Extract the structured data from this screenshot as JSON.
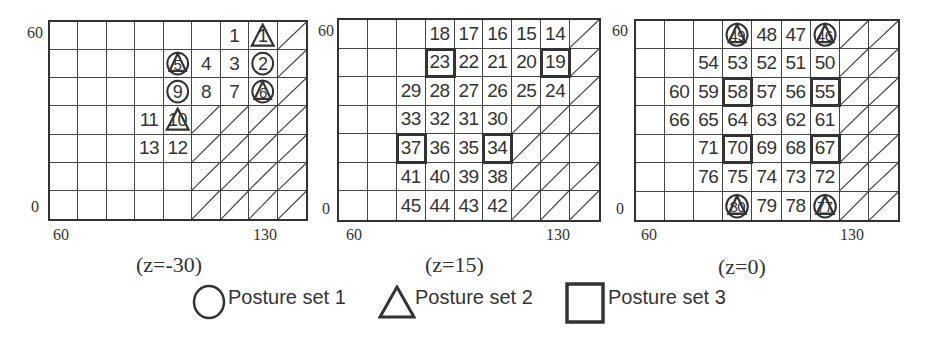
{
  "figure": {
    "grid_cols": 9,
    "grid_rows": 7,
    "axis_ticks": {
      "x_left": "60",
      "x_right": "130",
      "y_top": "60",
      "y_bottom": "0"
    },
    "panels": [
      {
        "caption": "(z=-30)",
        "box": {
          "left": 48,
          "top": 20,
          "width": 260,
          "height": 201
        },
        "cells": [
          [
            "",
            "",
            "",
            "",
            "",
            "",
            "1",
            "1",
            "#"
          ],
          [
            "",
            "",
            "",
            "",
            "5",
            "4",
            "3",
            "2",
            "#"
          ],
          [
            "",
            "",
            "",
            "",
            "9",
            "8",
            "7",
            "6",
            "#"
          ],
          [
            "",
            "",
            "",
            "11",
            "10",
            "#",
            "#",
            "#",
            "#"
          ],
          [
            "",
            "",
            "",
            "13",
            "12",
            "#",
            "#",
            "#",
            "#"
          ],
          [
            "",
            "",
            "",
            "",
            "",
            "#",
            "#",
            "#",
            "#"
          ],
          [
            "",
            "",
            "",
            "",
            "",
            "#",
            "#",
            "#",
            "#"
          ]
        ],
        "markers": [
          {
            "row": 0,
            "col": 7,
            "label": "1",
            "sets": [
              "triangle"
            ]
          },
          {
            "row": 1,
            "col": 4,
            "label": "5",
            "sets": [
              "circle",
              "triangle"
            ]
          },
          {
            "row": 1,
            "col": 7,
            "label": "2",
            "sets": [
              "circle"
            ]
          },
          {
            "row": 2,
            "col": 4,
            "label": "9",
            "sets": [
              "circle"
            ]
          },
          {
            "row": 2,
            "col": 7,
            "label": "6",
            "sets": [
              "circle",
              "triangle"
            ]
          },
          {
            "row": 3,
            "col": 4,
            "label": "10",
            "sets": [
              "triangle"
            ]
          }
        ],
        "tick_positions": {
          "x_left": [
            53,
            226
          ],
          "x_right": [
            253,
            226
          ],
          "y_top": [
            27,
            24
          ],
          "y_bottom": [
            31,
            198
          ]
        }
      },
      {
        "caption": "(z=15)",
        "box": {
          "left": 337,
          "top": 18,
          "width": 264,
          "height": 204
        },
        "cells": [
          [
            "",
            "",
            "",
            "18",
            "17",
            "16",
            "15",
            "14",
            "#"
          ],
          [
            "",
            "",
            "",
            "23",
            "22",
            "21",
            "20",
            "19",
            "#"
          ],
          [
            "",
            "",
            "29",
            "28",
            "27",
            "26",
            "25",
            "24",
            "#"
          ],
          [
            "",
            "",
            "33",
            "32",
            "31",
            "30",
            "#",
            "#",
            "#"
          ],
          [
            "",
            "",
            "37",
            "36",
            "35",
            "34",
            "#",
            "#",
            ""
          ],
          [
            "",
            "",
            "41",
            "40",
            "39",
            "38",
            "#",
            "#",
            "#"
          ],
          [
            "",
            "",
            "45",
            "44",
            "43",
            "42",
            "#",
            "#",
            "#"
          ]
        ],
        "markers": [
          {
            "row": 1,
            "col": 3,
            "label": "23",
            "sets": [
              "square"
            ]
          },
          {
            "row": 1,
            "col": 7,
            "label": "19",
            "sets": [
              "square"
            ]
          },
          {
            "row": 4,
            "col": 2,
            "label": "37",
            "sets": [
              "square"
            ]
          },
          {
            "row": 4,
            "col": 5,
            "label": "34",
            "sets": [
              "square"
            ]
          }
        ],
        "tick_positions": {
          "x_left": [
            346,
            226
          ],
          "x_right": [
            546,
            226
          ],
          "y_top": [
            318,
            22
          ],
          "y_bottom": [
            322,
            200
          ]
        }
      },
      {
        "caption": "(z=0)",
        "box": {
          "left": 634,
          "top": 19,
          "width": 266,
          "height": 203
        },
        "cells": [
          [
            "",
            "",
            "",
            "49",
            "48",
            "47",
            "46",
            "#",
            "#"
          ],
          [
            "",
            "",
            "54",
            "53",
            "52",
            "51",
            "50",
            "#",
            "#"
          ],
          [
            "",
            "60",
            "59",
            "58",
            "57",
            "56",
            "55",
            "#",
            "#"
          ],
          [
            "",
            "66",
            "65",
            "64",
            "63",
            "62",
            "61",
            "#",
            "#"
          ],
          [
            "",
            "",
            "71",
            "70",
            "69",
            "68",
            "67",
            "#",
            "#"
          ],
          [
            "",
            "",
            "76",
            "75",
            "74",
            "73",
            "72",
            "#",
            "#"
          ],
          [
            "",
            "",
            "",
            "80",
            "79",
            "78",
            "77",
            "#",
            "#"
          ]
        ],
        "markers": [
          {
            "row": 0,
            "col": 3,
            "label": "49",
            "sets": [
              "circle",
              "triangle"
            ]
          },
          {
            "row": 0,
            "col": 6,
            "label": "46",
            "sets": [
              "circle",
              "triangle"
            ]
          },
          {
            "row": 2,
            "col": 3,
            "label": "58",
            "sets": [
              "square"
            ]
          },
          {
            "row": 2,
            "col": 6,
            "label": "55",
            "sets": [
              "square"
            ]
          },
          {
            "row": 4,
            "col": 3,
            "label": "70",
            "sets": [
              "square"
            ]
          },
          {
            "row": 4,
            "col": 6,
            "label": "67",
            "sets": [
              "square"
            ]
          },
          {
            "row": 6,
            "col": 3,
            "label": "80",
            "sets": [
              "circle",
              "triangle"
            ]
          },
          {
            "row": 6,
            "col": 6,
            "label": "77",
            "sets": [
              "circle",
              "triangle"
            ]
          }
        ],
        "tick_positions": {
          "x_left": [
            641,
            226
          ],
          "x_right": [
            840,
            226
          ],
          "y_top": [
            612,
            22
          ],
          "y_bottom": [
            616,
            200
          ]
        }
      }
    ],
    "caption_positions": [
      [
        136,
        252
      ],
      [
        425,
        252
      ],
      [
        718,
        254
      ]
    ]
  },
  "legend": {
    "items": [
      {
        "shape": "circle",
        "label": "Posture set 1"
      },
      {
        "shape": "triangle",
        "label": "Posture set 2"
      },
      {
        "shape": "square",
        "label": "Posture set 3"
      }
    ]
  },
  "colors": {
    "line": "#333333",
    "text": "#333333",
    "background": "#ffffff"
  }
}
